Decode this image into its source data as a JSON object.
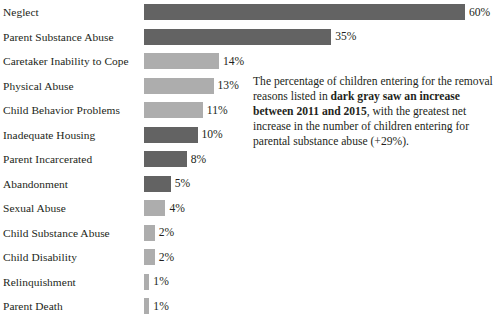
{
  "chart_data": {
    "type": "bar",
    "orientation": "horizontal",
    "title": "",
    "xlabel": "",
    "ylabel": "",
    "xlim": [
      0,
      60
    ],
    "grid": false,
    "legend": null,
    "value_suffix": "%",
    "colors": {
      "dark_gray": "#636363",
      "light_gray": "#adadad",
      "background": "#ffffff",
      "text": "#231f20"
    },
    "categories": [
      "Neglect",
      "Parent Substance Abuse",
      "Caretaker Inability to Cope",
      "Physical Abuse",
      "Child Behavior Problems",
      "Inadequate Housing",
      "Parent Incarcerated",
      "Abandonment",
      "Sexual Abuse",
      "Child Substance Abuse",
      "Child Disability",
      "Relinquishment",
      "Parent Death"
    ],
    "values": [
      60,
      35,
      14,
      13,
      11,
      10,
      8,
      5,
      4,
      2,
      2,
      1,
      1
    ],
    "value_labels": [
      "60%",
      "35%",
      "14%",
      "13%",
      "11%",
      "10%",
      "8%",
      "5%",
      "4%",
      "2%",
      "2%",
      "1%",
      "1%"
    ],
    "shades": [
      "dark",
      "dark",
      "light",
      "light",
      "light",
      "dark",
      "dark",
      "dark",
      "light",
      "light",
      "light",
      "light",
      "light"
    ],
    "bars": [
      {
        "label": "Neglect",
        "value": 60,
        "value_label": "60%",
        "shade": "dark"
      },
      {
        "label": "Parent Substance Abuse",
        "value": 35,
        "value_label": "35%",
        "shade": "dark"
      },
      {
        "label": "Caretaker Inability to Cope",
        "value": 14,
        "value_label": "14%",
        "shade": "light"
      },
      {
        "label": "Physical Abuse",
        "value": 13,
        "value_label": "13%",
        "shade": "light"
      },
      {
        "label": "Child Behavior Problems",
        "value": 11,
        "value_label": "11%",
        "shade": "light"
      },
      {
        "label": "Inadequate Housing",
        "value": 10,
        "value_label": "10%",
        "shade": "dark"
      },
      {
        "label": "Parent Incarcerated",
        "value": 8,
        "value_label": "8%",
        "shade": "dark"
      },
      {
        "label": "Abandonment",
        "value": 5,
        "value_label": "5%",
        "shade": "dark"
      },
      {
        "label": "Sexual Abuse",
        "value": 4,
        "value_label": "4%",
        "shade": "light"
      },
      {
        "label": "Child Substance Abuse",
        "value": 2,
        "value_label": "2%",
        "shade": "light"
      },
      {
        "label": "Child Disability",
        "value": 2,
        "value_label": "2%",
        "shade": "light"
      },
      {
        "label": "Relinquishment",
        "value": 1,
        "value_label": "1%",
        "shade": "light"
      },
      {
        "label": "Parent Death",
        "value": 1,
        "value_label": "1%",
        "shade": "light"
      }
    ],
    "annotations": [
      {
        "name": "dark-gray-increase-note",
        "text_parts": [
          {
            "text": "The percentage of children entering for the removal reasons listed in ",
            "bold": false
          },
          {
            "text": "dark gray saw an increase between 2011 and 2015",
            "bold": true
          },
          {
            "text": ", with the greatest net increase in the number of children entering for parental substance abuse (+29%).",
            "bold": false
          }
        ],
        "plain_text": "The percentage of children entering for the removal reasons listed in dark gray saw an increase between 2011 and 2015, with the greatest net increase in the number of children entering for parental substance abuse (+29%)."
      }
    ]
  }
}
